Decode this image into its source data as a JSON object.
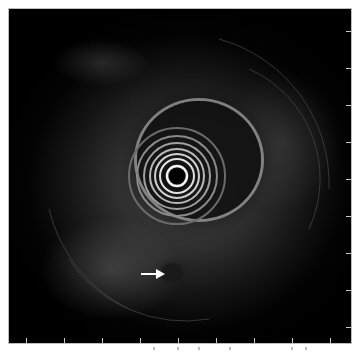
{
  "image": {
    "type": "endoscopic ultrasound",
    "background_color": "#000000",
    "frame_border_color": "#bdbdbd",
    "annotation": {
      "kind": "arrow",
      "color": "#ffffff",
      "direction": "right",
      "target": "hypoechoic lesion"
    },
    "scale_ticks": {
      "bottom_count": 9,
      "right_count": 9
    }
  }
}
